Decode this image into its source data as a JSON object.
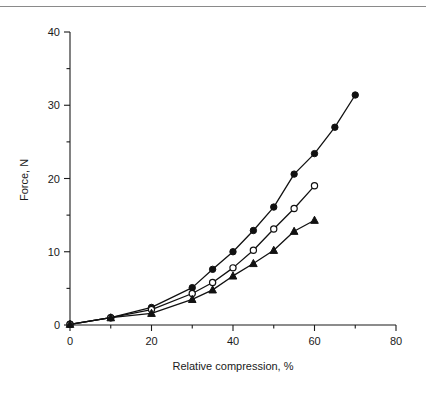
{
  "figure": {
    "background": "#ffffff",
    "ink_color": "#111111",
    "has_top_rule": true
  },
  "chart_data": {
    "type": "line",
    "title": "",
    "subtitle": "",
    "xlabel": "Relative compression, %",
    "ylabel": "Force, N",
    "xlim": [
      0,
      80
    ],
    "ylim": [
      0,
      40
    ],
    "xticks": [
      0,
      20,
      40,
      60,
      80
    ],
    "xticklabels": [
      "0",
      "20",
      "40",
      "60",
      "80"
    ],
    "xminorticks": [
      10,
      30,
      50,
      70
    ],
    "yticks": [
      0,
      10,
      20,
      30,
      40
    ],
    "yticklabels": [
      "0",
      "10",
      "20",
      "30",
      "40"
    ],
    "yminorticks": [
      5,
      15,
      25,
      35
    ],
    "grid": false,
    "legend": "none",
    "annotations": [],
    "series": [
      {
        "name": "Series 1",
        "marker": "filled-circle",
        "x": [
          0,
          10,
          20,
          30,
          35,
          40,
          45,
          50,
          55,
          60,
          65,
          70
        ],
        "y": [
          0.1,
          1.0,
          2.4,
          5.1,
          7.6,
          10.0,
          12.9,
          16.1,
          20.6,
          23.4,
          27.0,
          31.4
        ]
      },
      {
        "name": "Series 2",
        "marker": "open-circle",
        "x": [
          0,
          10,
          20,
          30,
          35,
          40,
          45,
          50,
          55,
          60
        ],
        "y": [
          0.1,
          1.0,
          2.1,
          4.3,
          5.8,
          7.8,
          10.2,
          13.1,
          15.9,
          19.0
        ]
      },
      {
        "name": "Series 3",
        "marker": "filled-triangle",
        "x": [
          0,
          10,
          20,
          30,
          35,
          40,
          45,
          50,
          55,
          60
        ],
        "y": [
          0.1,
          1.0,
          1.6,
          3.5,
          4.8,
          6.7,
          8.4,
          10.2,
          12.8,
          14.3
        ]
      }
    ]
  }
}
